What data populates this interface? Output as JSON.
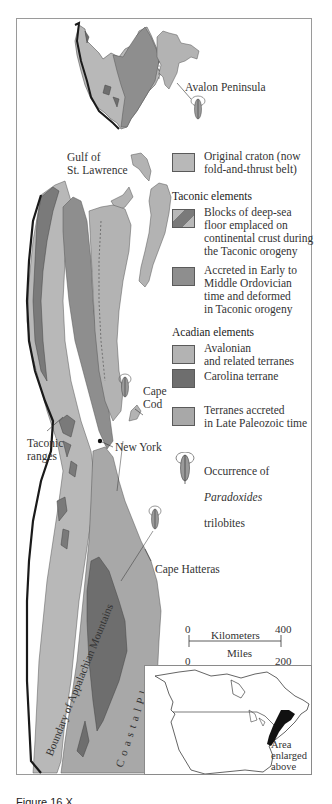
{
  "figure": {
    "caption_partial": "Figure 16.X",
    "colors": {
      "original_craton": "#b8b8b8",
      "deep_sea_floor_blocks": "#7a7a7a",
      "accreted_early_middle_ordovician": "#8e8e8e",
      "avalonian_terranes": "#b3b3b3",
      "carolina_terrane": "#6e6e6e",
      "late_paleozoic_terranes": "#a8a8a8",
      "coastal_plain": "#b0b0b0",
      "boundary_line": "#1a1a1a",
      "frame": "#9a9a9a"
    }
  },
  "map_labels": {
    "avalon_peninsula": "Avalon Peninsula",
    "gulf_of_st_lawrence": "Gulf of\nSt. Lawrence",
    "cape_cod": "Cape\nCod",
    "taconic_ranges": "Taconic\nranges",
    "new_york": "New York",
    "cape_hatteras": "Cape Hatteras",
    "boundary_appalachian": "Boundary of Appalachian Mountains",
    "coastal_plain": "C o a s t a l   P l a i n"
  },
  "legend": {
    "craton": {
      "label": "Original craton (now\nfold-and-thrust belt)"
    },
    "taconic_heading": "Taconic elements",
    "taconic_items": [
      {
        "label": "Blocks of deep-sea\nfloor emplaced on\ncontinental crust during\nthe Taconic orogeny"
      },
      {
        "label": "Accreted in Early to\nMiddle Ordovician\ntime and deformed\nin Taconic orogeny"
      }
    ],
    "acadian_heading": "Acadian elements",
    "acadian_items": [
      {
        "label": "Avalonian\nand related terranes"
      },
      {
        "label": "Carolina terrane"
      },
      {
        "label": "Terranes accreted\nin Late Paleozoic time"
      }
    ],
    "trilobite": {
      "line1": "Occurrence of",
      "line2_italic": "Paradoxides",
      "line3": "trilobites",
      "icon": "trilobite-icon"
    }
  },
  "scale_bar": {
    "km_start": "0",
    "km_unit": "Kilometers",
    "km_end": "400",
    "mi_start": "0",
    "mi_unit": "Miles",
    "mi_end": "200"
  },
  "inset": {
    "label": "Area\nenlarged\nabove"
  }
}
